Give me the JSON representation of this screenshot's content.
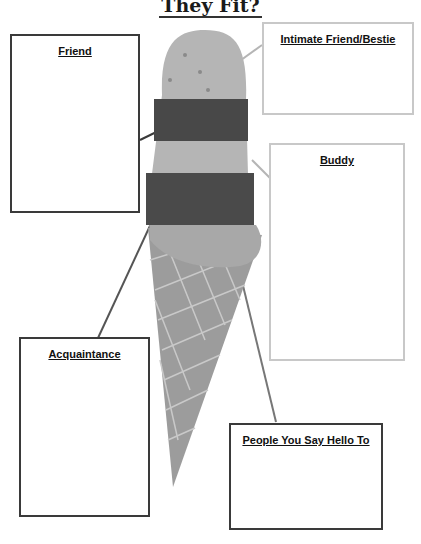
{
  "title": "They Fit?",
  "boxes": {
    "friend": "Friend",
    "intimate": "Intimate Friend/Bestie",
    "buddy": "Buddy",
    "acquaintance": "Acquaintance",
    "hello": "People You Say Hello To"
  },
  "colors": {
    "dark_border": "#3a3a3a",
    "light_border": "#c8c8c8",
    "cone": "#9a9a9a",
    "scoop_light": "#b8b8b8",
    "band_dark": "#4a4a4a"
  }
}
